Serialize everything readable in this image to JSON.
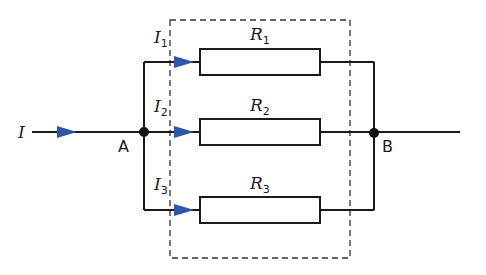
{
  "diagram": {
    "type": "parallel-resistor-circuit",
    "colors": {
      "wire": "#1a1a1a",
      "arrow": "#2f56a6",
      "dashed_box": "#333333",
      "resistor_fill": "#ffffff"
    },
    "main_current": {
      "symbol": "I",
      "subscript": ""
    },
    "nodes": [
      {
        "id": "A",
        "label": "A"
      },
      {
        "id": "B",
        "label": "B"
      }
    ],
    "branches": [
      {
        "current_symbol": "I",
        "current_subscript": "1",
        "resistor_symbol": "R",
        "resistor_subscript": "1"
      },
      {
        "current_symbol": "I",
        "current_subscript": "2",
        "resistor_symbol": "R",
        "resistor_subscript": "2"
      },
      {
        "current_symbol": "I",
        "current_subscript": "3",
        "resistor_symbol": "R",
        "resistor_subscript": "3"
      }
    ]
  }
}
